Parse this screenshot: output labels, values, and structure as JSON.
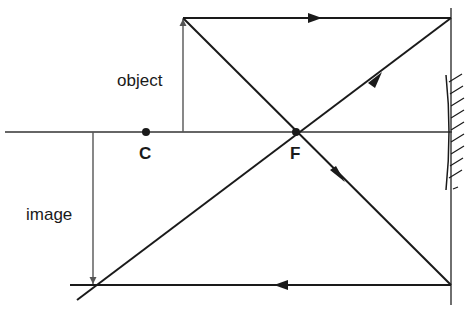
{
  "diagram": {
    "type": "ray-diagram-concave-mirror",
    "colors": {
      "stroke": "#1a1a1a",
      "axis": "#333333",
      "background": "#ffffff"
    },
    "labels": {
      "object": "object",
      "image": "image",
      "center_of_curvature": "C",
      "focal_point": "F"
    },
    "points": {
      "C": {
        "x": 146,
        "y": 132
      },
      "F": {
        "x": 296,
        "y": 132
      }
    },
    "principal_axis": {
      "x1": 5,
      "y1": 132,
      "x2": 452,
      "y2": 132
    },
    "mirror": {
      "x": 451,
      "y_top": 8,
      "y_bottom": 305,
      "hatch_side": "right"
    },
    "object_arrow": {
      "x": 183,
      "y_base": 132,
      "y_tip": 18,
      "direction": "up"
    },
    "image_arrow": {
      "x": 93,
      "y_base": 132,
      "y_tip": 285,
      "direction": "down"
    },
    "rays": [
      {
        "name": "parallel-ray-incident",
        "from": [
          183,
          18
        ],
        "to": [
          451,
          18
        ],
        "arrow": "right"
      },
      {
        "name": "reflected-through-focus",
        "from": [
          451,
          18
        ],
        "to": [
          77,
          300
        ],
        "arrow": "down-left"
      },
      {
        "name": "focal-ray-incident",
        "from": [
          183,
          18
        ],
        "to": [
          451,
          285
        ],
        "arrow": "down-right"
      },
      {
        "name": "reflected-parallel",
        "from": [
          451,
          285
        ],
        "to": [
          70,
          285
        ],
        "arrow": "left"
      }
    ]
  }
}
